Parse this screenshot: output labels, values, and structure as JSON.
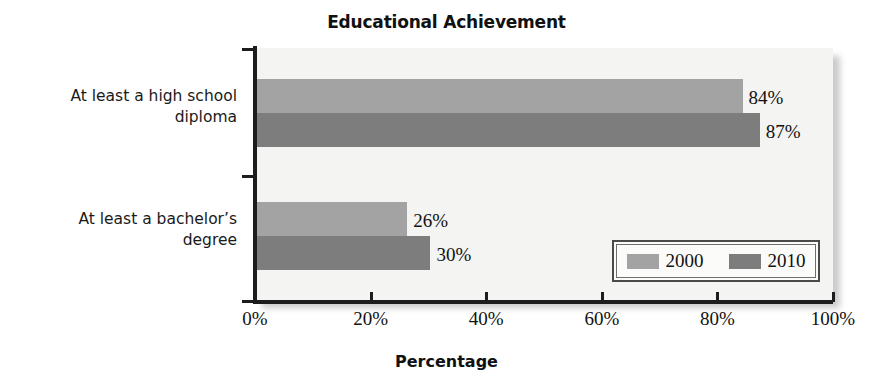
{
  "chart_data": {
    "type": "bar",
    "orientation": "horizontal",
    "title": "Educational Achievement",
    "xlabel": "Percentage",
    "ylabel": "",
    "categories": [
      "At least a high school diploma",
      "At least a bachelor’s degree"
    ],
    "category_lines": [
      [
        "At least a high school",
        "diploma"
      ],
      [
        "At least a bachelor’s",
        "degree"
      ]
    ],
    "series": [
      {
        "name": "2000",
        "color": "#a3a3a3",
        "values": [
          84,
          26
        ],
        "labels": [
          "84%",
          "26%"
        ]
      },
      {
        "name": "2010",
        "color": "#7d7d7d",
        "values": [
          87,
          30
        ],
        "labels": [
          "87%",
          "30%"
        ]
      }
    ],
    "xlim": [
      0,
      100
    ],
    "xticks": [
      0,
      20,
      40,
      60,
      80,
      100
    ],
    "xtick_labels": [
      "0%",
      "20%",
      "40%",
      "60%",
      "80%",
      "100%"
    ],
    "grid": false,
    "legend": {
      "position": "inner-lower-right",
      "entries": [
        "2000",
        "2010"
      ]
    },
    "plot_background": "#f4f4f2",
    "axis_color": "#1d1d1d"
  }
}
